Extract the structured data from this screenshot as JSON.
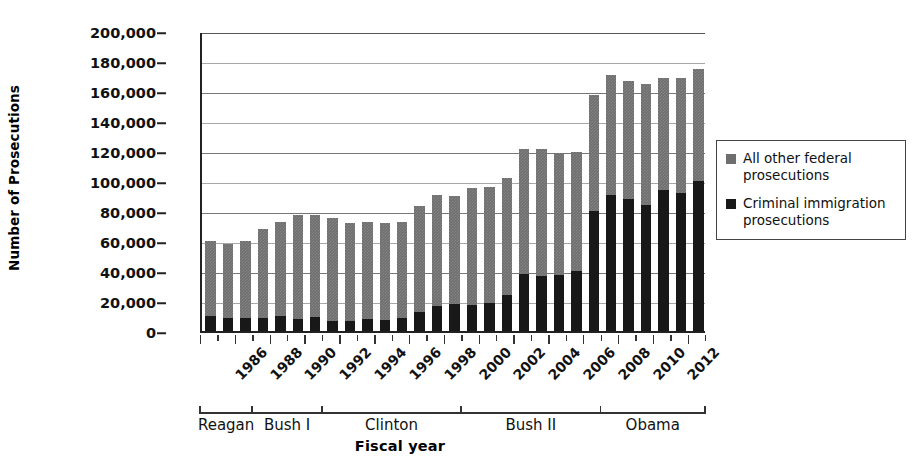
{
  "chart_data": {
    "type": "bar",
    "stacked": true,
    "title": "",
    "xlabel": "Fiscal year",
    "ylabel": "Number of Prosecutions",
    "ylim": [
      0,
      200000
    ],
    "ytick_step": 20000,
    "grid": true,
    "legend_position": "right",
    "categories": [
      1986,
      1987,
      1988,
      1989,
      1990,
      1991,
      1992,
      1993,
      1994,
      1995,
      1996,
      1997,
      1998,
      1999,
      2000,
      2001,
      2002,
      2003,
      2004,
      2005,
      2006,
      2007,
      2008,
      2009,
      2010,
      2011,
      2012,
      2013,
      2014
    ],
    "xtick_labels": [
      "1986",
      "",
      "1988",
      "",
      "1990",
      "",
      "1992",
      "",
      "1994",
      "",
      "1996",
      "",
      "1998",
      "",
      "2000",
      "",
      "2002",
      "",
      "2004",
      "",
      "2006",
      "",
      "2008",
      "",
      "2010",
      "",
      "2012",
      "",
      ""
    ],
    "ytick_labels": [
      "0",
      "20,000",
      "40,000",
      "60,000",
      "80,000",
      "100,000",
      "120,000",
      "140,000",
      "160,000",
      "180,000",
      "200,000"
    ],
    "ytick_values": [
      0,
      20000,
      40000,
      60000,
      80000,
      100000,
      120000,
      140000,
      160000,
      180000,
      200000
    ],
    "series": [
      {
        "name": "Criminal immigration prosecutions",
        "color": "#181818",
        "values": [
          10000,
          8500,
          8500,
          9000,
          10000,
          8000,
          9500,
          7000,
          7000,
          8000,
          7500,
          8500,
          12500,
          17000,
          18000,
          17500,
          18500,
          24000,
          38000,
          37000,
          37500,
          40000,
          80000,
          91000,
          88000,
          84000,
          94000,
          92000,
          100000
        ]
      },
      {
        "name": "All other federal prosecutions",
        "color": "#6e6e6e",
        "values": [
          50000,
          49500,
          51500,
          59000,
          62500,
          69500,
          68000,
          68500,
          65000,
          64500,
          64500,
          64500,
          71000,
          74000,
          72000,
          78000,
          77500,
          78000,
          83500,
          84500,
          81500,
          79500,
          77500,
          80000,
          79000,
          81000,
          74500,
          77000,
          75000
        ]
      }
    ],
    "totals": [
      60000,
      58000,
      60000,
      68000,
      72500,
      77500,
      77500,
      75500,
      72000,
      72500,
      72000,
      73000,
      83500,
      91000,
      90000,
      95500,
      96000,
      102000,
      121500,
      121500,
      119000,
      119500,
      157500,
      171000,
      167000,
      165000,
      168500,
      169000,
      175000
    ]
  },
  "axis": {
    "y_title": "Number of Prosecutions",
    "x_title": "Fiscal year"
  },
  "legend": {
    "items": [
      {
        "label": "All other federal prosecutions",
        "color": "#6e6e6e",
        "swatch": "square-marker-gray"
      },
      {
        "label": "Criminal immigration prosecutions",
        "color": "#181818",
        "swatch": "square-marker-black"
      }
    ]
  },
  "presidents": [
    {
      "name": "Reagan",
      "start_year": 1986,
      "end_year": 1988
    },
    {
      "name": "Bush I",
      "start_year": 1989,
      "end_year": 1992
    },
    {
      "name": "Clinton",
      "start_year": 1993,
      "end_year": 2000
    },
    {
      "name": "Bush II",
      "start_year": 2001,
      "end_year": 2008
    },
    {
      "name": "Obama",
      "start_year": 2009,
      "end_year": 2014
    }
  ]
}
